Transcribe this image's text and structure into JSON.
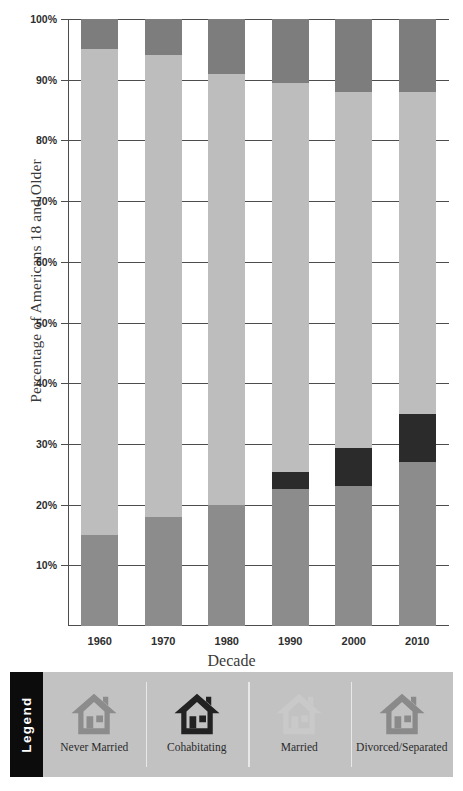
{
  "chart_data": {
    "type": "bar",
    "subtype": "stacked-percentage",
    "title": "",
    "xlabel": "Decade",
    "ylabel": "Percentage of Americans 18 and Older",
    "categories": [
      "1960",
      "1970",
      "1980",
      "1990",
      "2000",
      "2010"
    ],
    "ylim": [
      0,
      100
    ],
    "ytick_values": [
      10,
      20,
      30,
      40,
      50,
      60,
      70,
      80,
      90,
      100
    ],
    "ytick_labels": [
      "10%",
      "20%",
      "30%",
      "40%",
      "50%",
      "60%",
      "70%",
      "80%",
      "90%",
      "100%"
    ],
    "grid": true,
    "legend_position": "bottom",
    "series": [
      {
        "name": "Never Married",
        "color": "#8c8c8c",
        "values": [
          15,
          18,
          20,
          22.5,
          23,
          27
        ]
      },
      {
        "name": "Cohabitating",
        "color": "#2b2b2b",
        "values": [
          0,
          0,
          0,
          2.8,
          6.3,
          8
        ]
      },
      {
        "name": "Married",
        "color": "#bdbdbd",
        "values": [
          80,
          76,
          71,
          64.2,
          58.7,
          53
        ]
      },
      {
        "name": "Divorced/Separated",
        "color": "#7d7d7d",
        "values": [
          5,
          6,
          9,
          10.5,
          12,
          12
        ]
      }
    ]
  },
  "legend": {
    "banner_label": "Legend",
    "items": [
      {
        "label": "Never Married",
        "color": "#8c8c8c",
        "icon": "house-icon"
      },
      {
        "label": "Cohabitating",
        "color": "#222222",
        "icon": "house-icon"
      },
      {
        "label": "Married",
        "color": "#c9c9c9",
        "icon": "house-icon"
      },
      {
        "label": "Divorced/Separated",
        "color": "#8a8a8a",
        "icon": "house-icon"
      }
    ]
  }
}
